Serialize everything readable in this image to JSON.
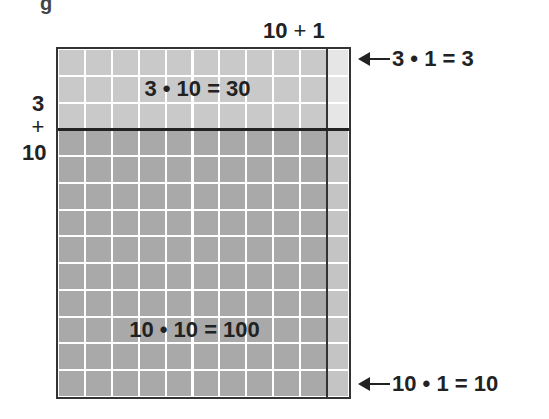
{
  "diagram": {
    "title_fragment": "g",
    "top_label": {
      "left": "10",
      "op": "+",
      "right": "1"
    },
    "side_label": {
      "top": "3",
      "op": "+",
      "bottom": "10"
    },
    "regions": {
      "top_left": {
        "text": "3 • 10 = 30",
        "rows": 3,
        "cols": 10,
        "color": "#c9c9c9"
      },
      "top_right": {
        "rows": 3,
        "cols": 1,
        "color": "#e6e6e6"
      },
      "bottom_left": {
        "text": "10 • 10 = 100",
        "rows": 10,
        "cols": 10,
        "color": "#a9a9a9"
      },
      "bottom_right": {
        "rows": 10,
        "cols": 1,
        "color": "#c4c4c4"
      }
    },
    "callouts": [
      {
        "text": "3 • 1 = 3"
      },
      {
        "text": "10 • 1 = 10"
      }
    ],
    "colors": {
      "border": "#333333",
      "gridline": "#ffffff"
    }
  }
}
